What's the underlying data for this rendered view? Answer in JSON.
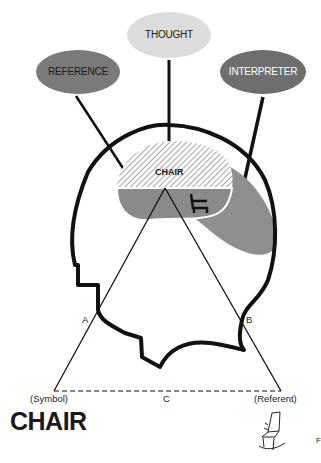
{
  "diagram": {
    "type": "semiotic triangle (Ogden-Richards) inside head profile",
    "bubbles": [
      {
        "id": "reference",
        "label": "REFERENCE",
        "color": "#7a7a7a",
        "text_color": "#1a1a1a"
      },
      {
        "id": "thought",
        "label": "THOUGHT",
        "color": "#dcdcdc",
        "text_color": "#1a1a1a"
      },
      {
        "id": "interpreter",
        "label": "INTERPRETER",
        "color": "#6e6e6e",
        "text_color": "#ffffff"
      }
    ],
    "brain": {
      "word": "CHAIR",
      "hatched_color": "#bdbdbd",
      "lower_color": "#8a8a8a",
      "interpreter_region_color": "#8f8f8f",
      "icon": "chair-icon"
    },
    "triangle": {
      "side_a": "A",
      "side_b": "B",
      "side_c": "C",
      "left_vertex_label": "(Symbol)",
      "right_vertex_label": "(Referent)"
    },
    "symbol_word": "CHAIR",
    "referent_icon": "rocking-chair-icon",
    "corner_mark": "F"
  }
}
